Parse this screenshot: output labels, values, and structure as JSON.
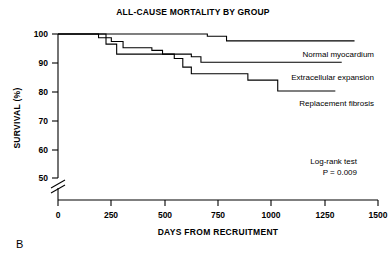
{
  "panel": {
    "label": "B"
  },
  "chart_data": {
    "type": "line",
    "subtype": "kaplan-meier-step",
    "title": "ALL-CAUSE MORTALITY BY GROUP",
    "xlabel": "DAYS FROM RECRUITMENT",
    "ylabel": "SURVIVAL (%)",
    "xlim": [
      0,
      1500
    ],
    "ylim": [
      50,
      100
    ],
    "y_axis_break": true,
    "y_break_note": "axis broken between 0 and 50",
    "grid": false,
    "legend_position": "inline-right-of-curves",
    "xticks": [
      0,
      250,
      500,
      750,
      1000,
      1250,
      1500
    ],
    "xtick_labels": [
      "0",
      "250",
      "500",
      "750",
      "1000",
      "1250",
      "1500"
    ],
    "yticks": [
      50,
      60,
      70,
      80,
      90,
      100
    ],
    "ytick_labels": [
      "50",
      "60",
      "70",
      "80",
      "90",
      "100"
    ],
    "annotations": [
      {
        "name": "log-rank-test",
        "text": "Log-rank test"
      },
      {
        "name": "p-value",
        "text": "P = 0.009"
      }
    ],
    "series": [
      {
        "name": "Normal myocardium",
        "label": "Normal myocardium",
        "color": "#000000",
        "points": [
          [
            0,
            100.0
          ],
          [
            690,
            100.0
          ],
          [
            700,
            99.2
          ],
          [
            780,
            99.2
          ],
          [
            790,
            97.6
          ],
          [
            1390,
            97.6
          ]
        ]
      },
      {
        "name": "Extracellular expansion",
        "label": "Extracellular expansion",
        "color": "#000000",
        "points": [
          [
            0,
            100.0
          ],
          [
            185,
            100.0
          ],
          [
            190,
            98.7
          ],
          [
            245,
            98.7
          ],
          [
            250,
            97.4
          ],
          [
            300,
            97.4
          ],
          [
            305,
            95.2
          ],
          [
            430,
            95.2
          ],
          [
            440,
            94.3
          ],
          [
            480,
            94.3
          ],
          [
            490,
            93.0
          ],
          [
            615,
            93.0
          ],
          [
            625,
            92.1
          ],
          [
            660,
            92.1
          ],
          [
            670,
            90.2
          ],
          [
            1330,
            90.2
          ]
        ]
      },
      {
        "name": "Replacement fibrosis",
        "label": "Replacement fibrosis",
        "color": "#000000",
        "points": [
          [
            0,
            100.0
          ],
          [
            215,
            100.0
          ],
          [
            225,
            96.5
          ],
          [
            265,
            96.5
          ],
          [
            275,
            93.0
          ],
          [
            535,
            93.0
          ],
          [
            545,
            91.5
          ],
          [
            575,
            91.5
          ],
          [
            585,
            88.5
          ],
          [
            615,
            88.5
          ],
          [
            625,
            86.2
          ],
          [
            880,
            86.2
          ],
          [
            890,
            84.0
          ],
          [
            1020,
            84.0
          ],
          [
            1030,
            80.2
          ],
          [
            1300,
            80.2
          ]
        ]
      }
    ]
  }
}
